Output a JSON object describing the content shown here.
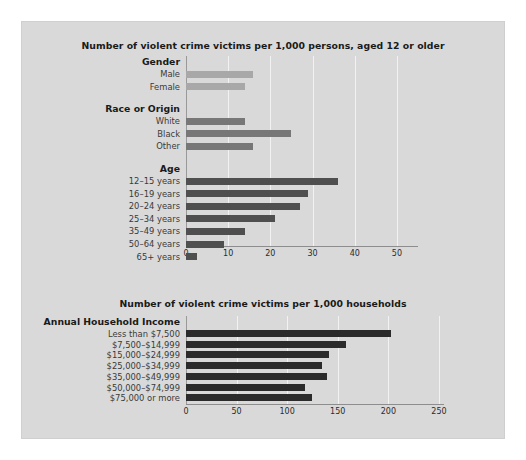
{
  "chart_data": [
    {
      "type": "bar",
      "orientation": "horizontal",
      "title": "Number of violent crime victims per 1,000 persons, aged 12 or older",
      "xlabel": "",
      "ylabel": "",
      "xlim": [
        0,
        55
      ],
      "xticks": [
        0,
        10,
        20,
        30,
        40,
        50
      ],
      "xticklabels": [
        "0",
        "10",
        "20",
        "30",
        "40",
        "50"
      ],
      "grid": true,
      "legend": "none",
      "groups": [
        {
          "name": "Gender",
          "color": "#a8a8a8",
          "categories": [
            "Male",
            "Female"
          ],
          "values": [
            16,
            14
          ]
        },
        {
          "name": "Race or Origin",
          "color": "#777777",
          "categories": [
            "White",
            "Black",
            "Other"
          ],
          "values": [
            14,
            25,
            16
          ]
        },
        {
          "name": "Age",
          "color": "#4f4f4f",
          "categories": [
            "12–15 years",
            "16–19 years",
            "20–24 years",
            "25–34 years",
            "35–49 years",
            "50–64 years",
            "65+ years"
          ],
          "values": [
            36,
            29,
            27,
            21,
            14,
            9,
            2.5
          ]
        }
      ]
    },
    {
      "type": "bar",
      "orientation": "horizontal",
      "title": "Number of violent crime victims per 1,000 households",
      "xlabel": "",
      "ylabel": "",
      "xlim": [
        0,
        255
      ],
      "xticks": [
        0,
        50,
        100,
        150,
        200,
        250
      ],
      "xticklabels": [
        "0",
        "50",
        "100",
        "150",
        "200",
        "250"
      ],
      "grid": true,
      "legend": "none",
      "groups": [
        {
          "name": "Annual Household Income",
          "color": "#2b2b2b",
          "categories": [
            "Less than $7,500",
            "$7,500–$14,999",
            "$15,000–$24,999",
            "$25,000–$34,999",
            "$35,000–$49,999",
            "$50,000–$74,999",
            "$75,000 or more"
          ],
          "values": [
            203,
            158,
            141,
            134,
            139,
            118,
            125
          ]
        }
      ]
    }
  ],
  "colors": {
    "panel_background": "#d9d9d9",
    "page_background": "#ffffff",
    "gridline": "#f2f2f2",
    "axis": "#8d8d8d",
    "bar_light": "#a8a8a8",
    "bar_mid": "#777777",
    "bar_dark": "#4f4f4f",
    "bar_black": "#2b2b2b",
    "text": "#1a1a1a"
  }
}
